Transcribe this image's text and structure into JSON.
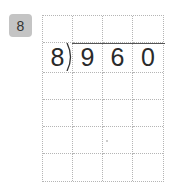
{
  "problem": {
    "number": "8",
    "divisor": "8",
    "dividend_digits": [
      "9",
      "6",
      "0"
    ]
  },
  "grid": {
    "rows": 6,
    "cols": 4,
    "cells": [
      [
        "",
        "",
        "",
        ""
      ],
      [
        "8",
        "9",
        "6",
        "0"
      ],
      [
        "",
        "",
        "",
        ""
      ],
      [
        "",
        "",
        "",
        ""
      ],
      [
        "",
        "",
        "",
        ""
      ],
      [
        "",
        "",
        "",
        ""
      ]
    ]
  },
  "colors": {
    "badge_bg": "#c4c4c4",
    "grid_line": "#b5b5b5",
    "text": "#2a2a2a"
  }
}
